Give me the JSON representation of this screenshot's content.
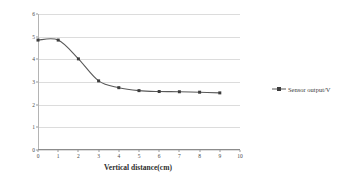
{
  "chart_data": {
    "type": "line",
    "title": "",
    "xlabel": "Vertical distance(cm)",
    "ylabel": "Sensor output (V)",
    "xlim": [
      0,
      10
    ],
    "ylim": [
      0,
      6
    ],
    "xticks": [
      0,
      1,
      2,
      3,
      4,
      5,
      6,
      7,
      8,
      9,
      10
    ],
    "yticks": [
      0,
      1,
      2,
      3,
      4,
      5,
      6
    ],
    "grid": "horizontal",
    "legend_position": "right-outside",
    "series": [
      {
        "name": "Sensor output/V",
        "color": "#595959",
        "marker": "square",
        "x": [
          0,
          1,
          2,
          3,
          4,
          5,
          6,
          7,
          8,
          9
        ],
        "values": [
          4.85,
          4.85,
          4.02,
          3.05,
          2.75,
          2.62,
          2.58,
          2.57,
          2.55,
          2.52
        ]
      }
    ]
  },
  "legend": {
    "entries": [
      {
        "label": "Sensor output/V"
      }
    ]
  },
  "axes": {
    "y_title": "Sensor output (V)",
    "x_title": "Vertical distance(cm)"
  }
}
